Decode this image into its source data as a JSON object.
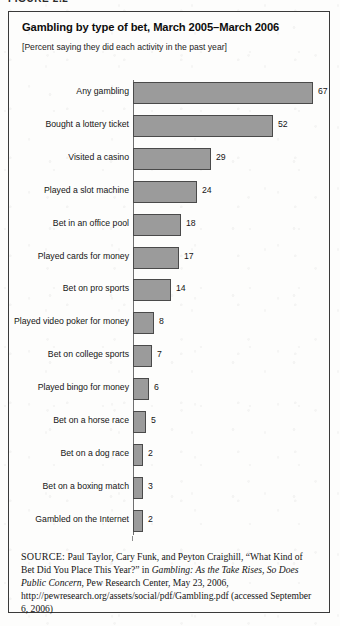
{
  "figure": {
    "caption_label": "FIGURE 2.2"
  },
  "header": {
    "title": "Gambling by type of bet, March 2005–March 2006",
    "subtitle": "[Percent saying they did each activity in the past year]"
  },
  "chart_data": {
    "type": "bar",
    "orientation": "horizontal",
    "title": "Gambling by type of bet, March 2005–March 2006",
    "subtitle": "[Percent saying they did each activity in the past year]",
    "xlabel": "",
    "ylabel": "",
    "unit": "percent",
    "grid": false,
    "legend": false,
    "xlim": [
      0,
      67
    ],
    "categories": [
      "Any gambling",
      "Bought a lottery ticket",
      "Visited a casino",
      "Played a slot machine",
      "Bet in an office pool",
      "Played cards for money",
      "Bet on pro sports",
      "Played video poker for money",
      "Bet on college sports",
      "Played bingo for money",
      "Bet on a horse race",
      "Bet on a dog race",
      "Bet on a boxing match",
      "Gambled on the Internet"
    ],
    "values": [
      67,
      52,
      29,
      24,
      18,
      17,
      14,
      8,
      7,
      6,
      5,
      2,
      3,
      2
    ],
    "bar_color": "#9b9b9b",
    "bar_edge_color": "#4a4a4a"
  },
  "source": {
    "label": "SOURCE:",
    "text_before_italic": " Paul Taylor, Cary Funk, and Peyton Craighill, “What Kind of Bet Did You Place This Year?” in ",
    "italic_title": "Gambling: As the Take Rises, So Does Public Concern",
    "text_after_italic": ", Pew Research Center, May 23, 2006, http://pewresearch.org/assets/social/pdf/Gambling.pdf (accessed September 6, 2006)"
  }
}
